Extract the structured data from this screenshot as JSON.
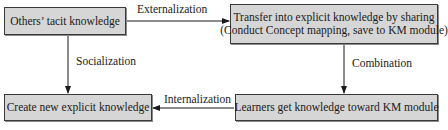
{
  "diagram": {
    "nodes": [
      {
        "id": "tacit",
        "lines": [
          "Others’ tacit knowledge"
        ]
      },
      {
        "id": "transfer",
        "lines": [
          "Transfer into explicit knowledge by sharing",
          "(Conduct Concept mapping, save to KM module)"
        ]
      },
      {
        "id": "create",
        "lines": [
          "Create new explicit knowledge"
        ]
      },
      {
        "id": "learners",
        "lines": [
          "Learners get knowledge toward KM module"
        ]
      }
    ],
    "edges": [
      {
        "from": "tacit",
        "to": "transfer",
        "label": "Externalization"
      },
      {
        "from": "tacit",
        "to": "create",
        "label": "Socialization"
      },
      {
        "from": "transfer",
        "to": "learners",
        "label": "Combination"
      },
      {
        "from": "learners",
        "to": "create",
        "label": "Internalization"
      }
    ],
    "colors": {
      "box_fill": "#d6d6d6",
      "box_border": "#3a3a3a",
      "line": "#1a1a1a"
    }
  }
}
